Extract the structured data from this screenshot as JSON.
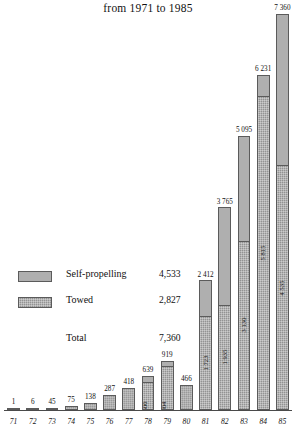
{
  "chart_data": {
    "type": "bar",
    "title": "from 1971 to 1985",
    "subtitle": "",
    "xlabel": "",
    "ylabel": "",
    "stacked": true,
    "grid": false,
    "ylim": [
      0,
      7360
    ],
    "legend_position": "inside-left",
    "categories": [
      "71",
      "72",
      "73",
      "74",
      "75",
      "76",
      "77",
      "78",
      "79",
      "80",
      "81",
      "82",
      "83",
      "84",
      "85"
    ],
    "totals": [
      "1",
      "6",
      "45",
      "75",
      "138",
      "287",
      "418",
      "639",
      "919",
      "466",
      "2 412",
      "3 765",
      "5 095",
      "6 231",
      "7 360"
    ],
    "total_values": [
      1,
      6,
      45,
      75,
      138,
      287,
      418,
      639,
      919,
      466,
      2412,
      3765,
      5095,
      6231,
      7360
    ],
    "series": [
      {
        "name": "Self-propelling",
        "fill": "light",
        "values": [
          1,
          6,
          45,
          75,
          138,
          287,
          418,
          139,
          115,
          466,
          689,
          1830,
          1965,
          416,
          2825
        ],
        "labels": [
          "",
          "",
          "",
          "",
          "",
          "",
          "",
          "",
          "",
          "",
          "",
          "",
          "",
          "",
          ""
        ]
      },
      {
        "name": "Towed",
        "fill": "stipple",
        "values": [
          0,
          0,
          0,
          0,
          0,
          0,
          0,
          500,
          804,
          0,
          1723,
          1935,
          3130,
          5815,
          4535
        ],
        "labels": [
          "",
          "",
          "",
          "",
          "",
          "",
          "",
          "500",
          "804",
          "1 171",
          "1 723",
          "1 935",
          "3 130",
          "5 815",
          "4 535"
        ]
      }
    ],
    "inbar_labels": {
      "78": "500",
      "79": "804",
      "80": "1 171",
      "81": "1 723",
      "82": "1 935",
      "83": "3 130",
      "84": "5 815",
      "85": "4 535"
    },
    "legend": [
      {
        "label": "Self-propelling",
        "value": "4,533",
        "fill": "light"
      },
      {
        "label": "Towed",
        "value": "2,827",
        "fill": "stipple"
      }
    ],
    "total_row": {
      "label": "Total",
      "value": "7,360"
    },
    "colors": {
      "self_propelling": "#9e9e9e",
      "towed": "#939393",
      "axis": "#4a4a4a",
      "text": "#111111",
      "background": "#ffffff"
    }
  }
}
